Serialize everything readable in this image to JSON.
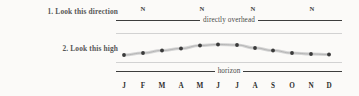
{
  "labels": {
    "step1": "1. Look this direction",
    "step2": "2. Look this high"
  },
  "rules": {
    "overhead": "directly overhead",
    "horizon": "horizon"
  },
  "direction_markers": [
    {
      "label": "N",
      "x": 27
    },
    {
      "label": "N",
      "x": 86
    },
    {
      "label": "N",
      "x": 137
    },
    {
      "label": "N",
      "x": 196
    }
  ],
  "colors": {
    "background": "#fbfaf8",
    "rule": "#3d3d3d",
    "guide": "#d2d2d2",
    "dot": "#3a3a3a",
    "band": "#d9d9d9",
    "label_text": "#565656",
    "month_text": "#2e2e2e"
  },
  "chart_data": {
    "type": "line",
    "title": "",
    "xlabel": "",
    "ylabel": "",
    "grid": false,
    "legend": null,
    "categories": [
      "J",
      "F",
      "M",
      "A",
      "M",
      "J",
      "J",
      "A",
      "S",
      "O",
      "N",
      "D"
    ],
    "category_names": [
      "January",
      "February",
      "March",
      "April",
      "May",
      "June",
      "July",
      "August",
      "September",
      "October",
      "November",
      "December"
    ],
    "yaxis_anchors": [
      "horizon",
      "directly overhead"
    ],
    "series": [
      {
        "name": "altitude",
        "values": [
          55,
          53,
          50.5,
          48.5,
          45.5,
          44.5,
          45,
          48,
          50.5,
          53,
          54,
          54.5
        ]
      }
    ],
    "x_pixels": [
      8,
      27,
      46,
      65,
      84,
      102,
      121,
      139,
      157,
      176,
      195,
      213
    ],
    "ylim": [
      70,
      21
    ]
  },
  "months": [
    {
      "label": "J",
      "x": 8
    },
    {
      "label": "F",
      "x": 27
    },
    {
      "label": "M",
      "x": 46
    },
    {
      "label": "A",
      "x": 65
    },
    {
      "label": "M",
      "x": 84
    },
    {
      "label": "J",
      "x": 102
    },
    {
      "label": "J",
      "x": 121
    },
    {
      "label": "A",
      "x": 139
    },
    {
      "label": "S",
      "x": 157
    },
    {
      "label": "O",
      "x": 176
    },
    {
      "label": "N",
      "x": 195
    },
    {
      "label": "D",
      "x": 213
    }
  ]
}
